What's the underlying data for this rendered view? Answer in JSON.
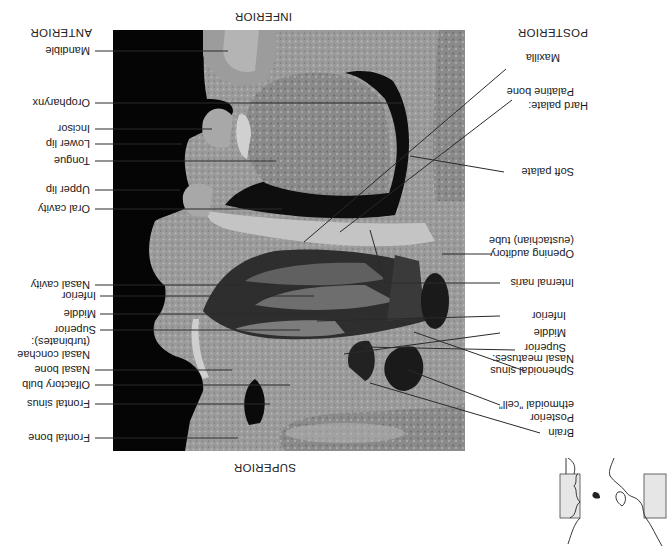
{
  "figure": {
    "orientation": {
      "top": "SUPERIOR",
      "bottom": "INFERIOR",
      "left": "POSTERIOR",
      "right": "ANTERIOR"
    },
    "rotation_degrees": 180,
    "anterior_labels": [
      {
        "id": "frontal-bone",
        "text": "Frontal bone"
      },
      {
        "id": "frontal-sinus",
        "text": "Frontal sinus"
      },
      {
        "id": "olfactory-bulb",
        "text": "Olfactory bulb"
      },
      {
        "id": "nasal-bone",
        "text": "Nasal bone"
      },
      {
        "id": "nasal-conchae-heading",
        "text": "Nasal conchae"
      },
      {
        "id": "nasal-conchae-subheading",
        "text": "(turbinates):"
      },
      {
        "id": "concha-superior",
        "text": "Superior"
      },
      {
        "id": "concha-middle",
        "text": "Middle"
      },
      {
        "id": "concha-inferior",
        "text": "Inferior"
      },
      {
        "id": "nasal-cavity",
        "text": "Nasal cavity"
      },
      {
        "id": "oral-cavity",
        "text": "Oral cavity"
      },
      {
        "id": "upper-lip",
        "text": "Upper lip"
      },
      {
        "id": "tongue",
        "text": "Tongue"
      },
      {
        "id": "lower-lip",
        "text": "Lower lip"
      },
      {
        "id": "incisor",
        "text": "Incisor"
      },
      {
        "id": "oropharynx",
        "text": "Oropharynx"
      },
      {
        "id": "mandible",
        "text": "Mandible"
      }
    ],
    "posterior_labels": [
      {
        "id": "brain",
        "text": "Brain"
      },
      {
        "id": "posterior-ethmoidal-1",
        "text": "Posterior"
      },
      {
        "id": "posterior-ethmoidal-2",
        "text": "ethmoidal \"cell\""
      },
      {
        "id": "sphenoidal-sinus",
        "text": "Sphenoidal sinus"
      },
      {
        "id": "nasal-meatuses-heading",
        "text": "Nasal meatuses:"
      },
      {
        "id": "meatus-superior",
        "text": "Superior"
      },
      {
        "id": "meatus-middle",
        "text": "Middle"
      },
      {
        "id": "meatus-inferior",
        "text": "Inferior"
      },
      {
        "id": "internal-naris",
        "text": "Internal naris"
      },
      {
        "id": "auditory-tube-1",
        "text": "Opening auditory"
      },
      {
        "id": "auditory-tube-2",
        "text": "(eustachian) tube"
      },
      {
        "id": "soft-palate",
        "text": "Soft palate"
      },
      {
        "id": "hard-palate-heading",
        "text": "Hard palate:"
      },
      {
        "id": "palatine-bone",
        "text": "Palatine bone"
      },
      {
        "id": "maxilla",
        "text": "Maxilla"
      }
    ],
    "inset_letter": "B"
  },
  "colors": {
    "background": "#ffffff",
    "photo_background": "#000000",
    "tissue_light": "#b8b8b8",
    "tissue_mid": "#8a8a8a",
    "tissue_dark": "#4a4a4a",
    "leader_line": "#2a2a2a",
    "inset_fill": "#e6e6e6"
  }
}
